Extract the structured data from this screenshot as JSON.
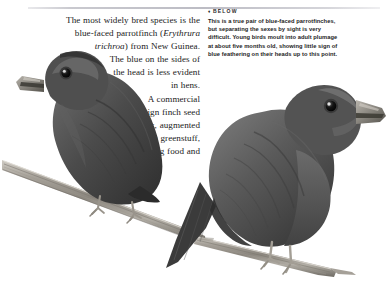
{
  "page": {
    "background_color": "#ffffff",
    "rule_color": "#bcbcc4",
    "text_color": "#1a1a1a"
  },
  "body_text": {
    "paragraph_1": "The most widely bred species is the blue-faced parrotfinch (Erythrura trichroa) from New Guinea. The blue on the sides of the head is less evident in hens.",
    "paragraph_2": "A commercial foreign finch seed mix, augmented with greenstuff, egg food and",
    "species_italic": "Erythrura trichroa",
    "lines": [
      "The most widely bred species is the",
      "blue-faced parrotfinch (Erythrura",
      "trichroa) from New Guinea.",
      "The blue on the sides of",
      "the head is less evident",
      "in hens.",
      "A commercial",
      "foreign finch seed",
      "mix, augmented",
      "with greenstuff,",
      "egg food and"
    ],
    "line_2_roman_head": "blue-faced parrotfinch (",
    "line_2_italic": "Erythrura",
    "line_3_italic": "trichroa",
    "line_3_roman_tail": ") from New Guinea."
  },
  "caption": {
    "marker": "♦",
    "label": "BELOW",
    "text": "This is a true pair of blue-faced parrotfinches, but separating the sexes by sight is very difficult. Young birds moult into adult plumage at about five months old, showing little sign of blue feathering on their heads up to this point.",
    "lines": [
      "This is a true pair of blue-faced parrotfinches,",
      "but separating the sexes by sight is very",
      "difficult. Young birds moult into adult plumage",
      "at about five months old, showing little sign of",
      "blue feathering on their heads up to this point."
    ]
  },
  "photograph": {
    "subject": "blue-faced parrotfinch pair",
    "style": "black-and-white photograph",
    "birds": [
      {
        "name": "left-bird",
        "pose": "facing right, upper body visible, perched on branch"
      },
      {
        "name": "right-bird",
        "pose": "full body in profile facing right, perched on branch"
      }
    ],
    "perch": {
      "name": "branch",
      "description": "diagonal wooden perch running lower-left to mid-right"
    },
    "plumage_color": "#4a4a4a",
    "beak_color": "#8f8d86",
    "eye_color": "#101010"
  }
}
